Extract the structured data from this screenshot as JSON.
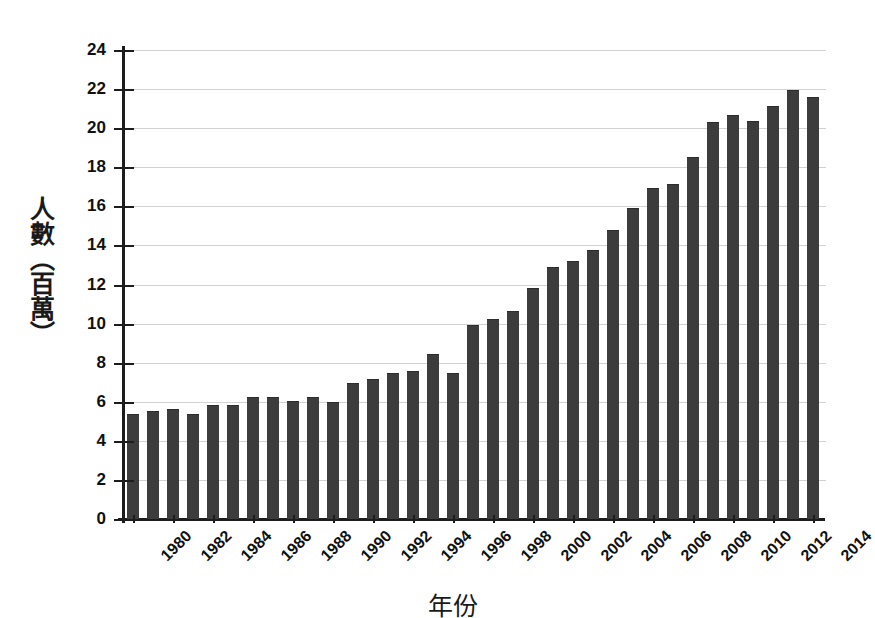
{
  "chart_data": {
    "type": "bar",
    "title": "",
    "xlabel": "年份",
    "ylabel": "人數（百萬）",
    "ylim": [
      0,
      24
    ],
    "ytick_step": 2,
    "grid": true,
    "legend": "none",
    "bar_color": "#3c3c3c",
    "axis_color": "#1c1c1c",
    "grid_color": "#d2d2d2",
    "ytick_labels": [
      "0",
      "2",
      "4",
      "6",
      "8",
      "10",
      "12",
      "14",
      "16",
      "18",
      "20",
      "22",
      "24"
    ],
    "xtick_labels": [
      "1980",
      "1982",
      "1984",
      "1986",
      "1988",
      "1990",
      "1992",
      "1994",
      "1996",
      "1998",
      "2000",
      "2002",
      "2004",
      "2006",
      "2008",
      "2010",
      "2012",
      "2014"
    ],
    "categories": [
      "1980",
      "1981",
      "1982",
      "1983",
      "1984",
      "1985",
      "1986",
      "1987",
      "1988",
      "1989",
      "1990",
      "1991",
      "1992",
      "1993",
      "1994",
      "1995",
      "1996",
      "1997",
      "1998",
      "1999",
      "2000",
      "2001",
      "2002",
      "2003",
      "2004",
      "2005",
      "2006",
      "2007",
      "2008",
      "2009",
      "2010",
      "2011",
      "2012",
      "2013",
      "2014"
    ],
    "values": [
      5.3,
      5.5,
      5.6,
      5.3,
      5.8,
      5.8,
      6.2,
      6.2,
      6.0,
      6.2,
      5.95,
      6.9,
      7.1,
      7.4,
      7.5,
      8.4,
      7.4,
      9.9,
      10.2,
      10.6,
      11.75,
      12.85,
      13.15,
      13.7,
      14.75,
      15.85,
      16.9,
      17.1,
      18.45,
      20.25,
      20.6,
      20.3,
      21.1,
      21.9,
      21.55
    ]
  }
}
